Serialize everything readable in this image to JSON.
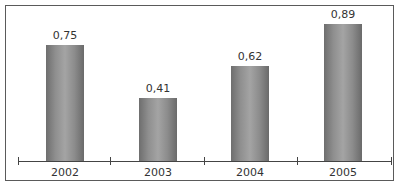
{
  "chart_data": {
    "type": "bar",
    "title": "",
    "xlabel": "",
    "ylabel": "",
    "categories": [
      "2002",
      "2003",
      "2004",
      "2005"
    ],
    "values": [
      0.75,
      0.41,
      0.62,
      0.89
    ],
    "value_labels": [
      "0,75",
      "0,41",
      "0,62",
      "0,89"
    ],
    "ylim": [
      0,
      1
    ],
    "grid": false,
    "legend": null,
    "bar_color": "#8f8f8f"
  }
}
